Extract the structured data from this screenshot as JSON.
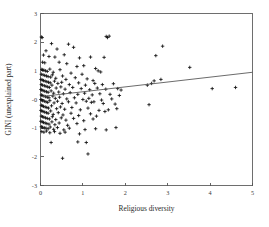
{
  "chart_data": {
    "type": "scatter",
    "title": "",
    "xlabel": "Religious diversity",
    "ylabel": "GINI (unexplained part)",
    "xlim": [
      0,
      5
    ],
    "ylim": [
      -3,
      3
    ],
    "xticks": [
      "0",
      "1",
      "2",
      "3",
      "4",
      "5"
    ],
    "xtickvalues": [
      0,
      1,
      2,
      3,
      4,
      5
    ],
    "yticks": [
      "3",
      "2",
      "1",
      "-0",
      "-1",
      "-2",
      "-3"
    ],
    "ytickvalues": [
      3,
      2,
      1,
      0,
      -1,
      -2,
      -3
    ],
    "grid": false,
    "legend": null,
    "marker_style": "plus",
    "marker_color": "#111111",
    "frame_color": "#6e6e6e",
    "fit_line": {
      "name": "linear fit",
      "x": [
        0,
        5
      ],
      "y": [
        0.1,
        0.95
      ],
      "color": "#5a5a5a"
    },
    "points": [
      [
        0.02,
        2.18
      ],
      [
        0.04,
        2.16
      ],
      [
        0.26,
        1.95
      ],
      [
        0.66,
        1.93
      ],
      [
        1.55,
        2.2
      ],
      [
        1.62,
        2.21
      ],
      [
        1.58,
        2.16
      ],
      [
        0.13,
        1.7
      ],
      [
        0.39,
        1.76
      ],
      [
        0.78,
        1.82
      ],
      [
        2.88,
        1.86
      ],
      [
        0.07,
        1.55
      ],
      [
        0.2,
        1.5
      ],
      [
        0.34,
        1.48
      ],
      [
        0.56,
        1.56
      ],
      [
        0.92,
        1.45
      ],
      [
        1.18,
        1.48
      ],
      [
        1.5,
        1.47
      ],
      [
        2.72,
        1.53
      ],
      [
        0.05,
        1.3
      ],
      [
        0.1,
        1.28
      ],
      [
        0.44,
        1.3
      ],
      [
        0.62,
        1.25
      ],
      [
        0.86,
        1.15
      ],
      [
        1.02,
        1.18
      ],
      [
        1.3,
        1.08
      ],
      [
        3.52,
        1.12
      ],
      [
        0.03,
        1.05
      ],
      [
        0.05,
        1.03
      ],
      [
        0.08,
        1.02
      ],
      [
        0.12,
        1.0
      ],
      [
        0.16,
        0.98
      ],
      [
        0.22,
        1.06
      ],
      [
        0.3,
        0.95
      ],
      [
        0.46,
        1.04
      ],
      [
        0.72,
        0.92
      ],
      [
        0.98,
        0.88
      ],
      [
        1.36,
        1.0
      ],
      [
        1.42,
        0.96
      ],
      [
        0.02,
        0.88
      ],
      [
        0.06,
        0.86
      ],
      [
        0.1,
        0.84
      ],
      [
        0.14,
        0.82
      ],
      [
        0.18,
        0.8
      ],
      [
        0.24,
        0.78
      ],
      [
        0.28,
        0.86
      ],
      [
        0.36,
        0.74
      ],
      [
        0.52,
        0.82
      ],
      [
        0.6,
        0.7
      ],
      [
        0.82,
        0.76
      ],
      [
        1.1,
        0.72
      ],
      [
        1.24,
        0.66
      ],
      [
        2.68,
        0.65
      ],
      [
        2.84,
        0.7
      ],
      [
        0.01,
        0.7
      ],
      [
        0.04,
        0.68
      ],
      [
        0.07,
        0.66
      ],
      [
        0.11,
        0.64
      ],
      [
        0.15,
        0.62
      ],
      [
        0.19,
        0.6
      ],
      [
        0.23,
        0.58
      ],
      [
        0.33,
        0.64
      ],
      [
        0.41,
        0.56
      ],
      [
        0.5,
        0.6
      ],
      [
        0.68,
        0.52
      ],
      [
        0.9,
        0.58
      ],
      [
        1.06,
        0.5
      ],
      [
        1.28,
        0.56
      ],
      [
        1.46,
        0.52
      ],
      [
        1.72,
        0.55
      ],
      [
        2.52,
        0.5
      ],
      [
        2.62,
        0.56
      ],
      [
        0.02,
        0.52
      ],
      [
        0.05,
        0.5
      ],
      [
        0.09,
        0.48
      ],
      [
        0.13,
        0.46
      ],
      [
        0.17,
        0.44
      ],
      [
        0.21,
        0.42
      ],
      [
        0.27,
        0.5
      ],
      [
        0.37,
        0.4
      ],
      [
        0.48,
        0.44
      ],
      [
        0.58,
        0.36
      ],
      [
        0.76,
        0.42
      ],
      [
        0.96,
        0.38
      ],
      [
        1.16,
        0.34
      ],
      [
        1.34,
        0.4
      ],
      [
        1.54,
        0.36
      ],
      [
        1.82,
        0.38
      ],
      [
        1.9,
        0.33
      ],
      [
        0.01,
        0.35
      ],
      [
        0.03,
        0.33
      ],
      [
        0.06,
        0.31
      ],
      [
        0.1,
        0.29
      ],
      [
        0.14,
        0.27
      ],
      [
        0.18,
        0.25
      ],
      [
        0.25,
        0.3
      ],
      [
        0.31,
        0.22
      ],
      [
        0.43,
        0.26
      ],
      [
        0.54,
        0.2
      ],
      [
        0.7,
        0.24
      ],
      [
        0.88,
        0.18
      ],
      [
        1.04,
        0.22
      ],
      [
        1.22,
        0.16
      ],
      [
        1.4,
        0.2
      ],
      [
        1.64,
        0.18
      ],
      [
        1.86,
        0.14
      ],
      [
        4.6,
        0.42
      ],
      [
        4.05,
        0.38
      ],
      [
        0.02,
        0.16
      ],
      [
        0.04,
        0.14
      ],
      [
        0.08,
        0.12
      ],
      [
        0.12,
        0.1
      ],
      [
        0.16,
        0.08
      ],
      [
        0.2,
        0.06
      ],
      [
        0.29,
        0.12
      ],
      [
        0.35,
        0.04
      ],
      [
        0.45,
        0.08
      ],
      [
        0.62,
        0.02
      ],
      [
        0.8,
        0.06
      ],
      [
        1.0,
        0.0
      ],
      [
        1.14,
        0.04
      ],
      [
        1.44,
        -0.02
      ],
      [
        1.68,
        0.02
      ],
      [
        0.01,
        0.0
      ],
      [
        0.03,
        -0.02
      ],
      [
        0.05,
        -0.04
      ],
      [
        0.09,
        -0.06
      ],
      [
        0.13,
        -0.08
      ],
      [
        0.17,
        -0.1
      ],
      [
        0.22,
        -0.04
      ],
      [
        0.32,
        -0.12
      ],
      [
        0.4,
        -0.06
      ],
      [
        0.51,
        -0.14
      ],
      [
        0.66,
        -0.08
      ],
      [
        0.84,
        -0.12
      ],
      [
        1.08,
        -0.06
      ],
      [
        1.2,
        -0.1
      ],
      [
        1.26,
        -0.08
      ],
      [
        1.48,
        -0.14
      ],
      [
        1.76,
        -0.16
      ],
      [
        2.56,
        -0.18
      ],
      [
        0.02,
        -0.2
      ],
      [
        0.04,
        -0.22
      ],
      [
        0.07,
        -0.24
      ],
      [
        0.11,
        -0.26
      ],
      [
        0.15,
        -0.28
      ],
      [
        0.19,
        -0.3
      ],
      [
        0.26,
        -0.22
      ],
      [
        0.38,
        -0.32
      ],
      [
        0.47,
        -0.26
      ],
      [
        0.57,
        -0.34
      ],
      [
        0.74,
        -0.28
      ],
      [
        0.94,
        -0.36
      ],
      [
        1.12,
        -0.3
      ],
      [
        1.38,
        -0.38
      ],
      [
        1.52,
        -0.42
      ],
      [
        1.6,
        -0.36
      ],
      [
        1.8,
        -0.32
      ],
      [
        0.01,
        -0.38
      ],
      [
        0.03,
        -0.4
      ],
      [
        0.06,
        -0.42
      ],
      [
        0.1,
        -0.44
      ],
      [
        0.14,
        -0.46
      ],
      [
        0.18,
        -0.48
      ],
      [
        0.24,
        -0.4
      ],
      [
        0.3,
        -0.52
      ],
      [
        0.42,
        -0.46
      ],
      [
        0.53,
        -0.54
      ],
      [
        0.72,
        -0.48
      ],
      [
        0.9,
        -0.56
      ],
      [
        1.18,
        -0.5
      ],
      [
        1.32,
        -0.58
      ],
      [
        0.02,
        -0.58
      ],
      [
        0.05,
        -0.6
      ],
      [
        0.08,
        -0.62
      ],
      [
        0.12,
        -0.64
      ],
      [
        0.16,
        -0.66
      ],
      [
        0.21,
        -0.68
      ],
      [
        0.28,
        -0.6
      ],
      [
        0.36,
        -0.7
      ],
      [
        0.49,
        -0.64
      ],
      [
        0.6,
        -0.72
      ],
      [
        0.78,
        -0.66
      ],
      [
        1.02,
        -0.74
      ],
      [
        1.24,
        -0.68
      ],
      [
        0.01,
        -0.76
      ],
      [
        0.04,
        -0.78
      ],
      [
        0.07,
        -0.8
      ],
      [
        0.11,
        -0.82
      ],
      [
        0.15,
        -0.84
      ],
      [
        0.2,
        -0.86
      ],
      [
        0.27,
        -0.78
      ],
      [
        0.34,
        -0.88
      ],
      [
        0.44,
        -0.82
      ],
      [
        0.64,
        -0.9
      ],
      [
        0.86,
        -0.84
      ],
      [
        0.02,
        -0.95
      ],
      [
        0.05,
        -0.97
      ],
      [
        0.09,
        -0.99
      ],
      [
        0.13,
        -1.0
      ],
      [
        0.18,
        -1.02
      ],
      [
        0.23,
        -0.96
      ],
      [
        0.31,
        -1.04
      ],
      [
        0.4,
        -0.98
      ],
      [
        0.55,
        -1.06
      ],
      [
        0.68,
        -1.0
      ],
      [
        1.05,
        -1.05
      ],
      [
        1.3,
        -1.02
      ],
      [
        1.55,
        -1.06
      ],
      [
        1.78,
        -0.98
      ],
      [
        0.03,
        -1.12
      ],
      [
        0.08,
        -1.14
      ],
      [
        0.14,
        -1.1
      ],
      [
        0.22,
        -1.16
      ],
      [
        0.33,
        -1.12
      ],
      [
        0.46,
        -1.18
      ],
      [
        0.58,
        -1.14
      ],
      [
        0.92,
        -1.2
      ],
      [
        0.25,
        -1.5
      ],
      [
        0.88,
        -1.48
      ],
      [
        1.08,
        -1.5
      ],
      [
        0.52,
        -2.05
      ],
      [
        1.12,
        -1.9
      ]
    ]
  }
}
